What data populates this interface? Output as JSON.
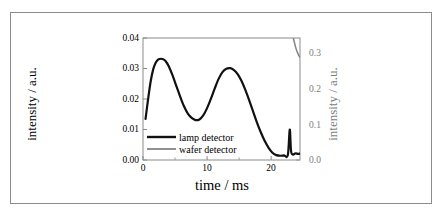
{
  "figure": {
    "border_color": "#8c8c8c",
    "background": "#ffffff"
  },
  "chart_data": {
    "type": "line",
    "title": "",
    "xlabel": "time / ms",
    "ylabel": "intensity / a.u.",
    "ylabel_right": "intensity / a.u.",
    "xlim": [
      0,
      24.5
    ],
    "ylim": [
      0.0,
      0.04
    ],
    "ylim_right": [
      0.0,
      0.0345
    ],
    "grid": false,
    "legend_position": "lower-left-inside",
    "xticks": [
      0,
      10,
      20
    ],
    "xticklabels": [
      "0",
      "10",
      "20"
    ],
    "xminorticks": [
      5,
      15
    ],
    "yticks": [
      0.0,
      0.01,
      0.02,
      0.03,
      0.04
    ],
    "yticklabels": [
      "0.00",
      "0.01",
      "0.02",
      "0.03",
      "0.04"
    ],
    "yticks_right": [
      0.0,
      0.1,
      0.2,
      0.3
    ],
    "yticklabels_right": [
      "0.0",
      "0.1",
      "0.2",
      "0.3"
    ],
    "yminorticks_right": [
      0.05,
      0.15,
      0.25
    ],
    "series": [
      {
        "name": "lamp detector",
        "color": "#111111",
        "axis": "left",
        "x": [
          0.4,
          0.8,
          1.2,
          1.6,
          2.0,
          2.4,
          2.8,
          3.2,
          3.6,
          4.0,
          4.6,
          5.2,
          5.8,
          6.4,
          7.0,
          7.6,
          8.2,
          8.8,
          9.4,
          10.0,
          10.6,
          11.2,
          11.8,
          12.4,
          13.0,
          13.6,
          14.2,
          14.8,
          15.4,
          16.0,
          16.6,
          17.2,
          17.8,
          18.4,
          19.0,
          19.6,
          20.2,
          20.8,
          21.4,
          22.0,
          22.6,
          22.9,
          23.1,
          23.4,
          23.8,
          24.2,
          24.5
        ],
        "y": [
          0.0135,
          0.02,
          0.0258,
          0.0298,
          0.032,
          0.033,
          0.0332,
          0.033,
          0.0322,
          0.0308,
          0.0278,
          0.0243,
          0.0208,
          0.0176,
          0.0152,
          0.0138,
          0.0131,
          0.0133,
          0.0146,
          0.017,
          0.0201,
          0.0235,
          0.0266,
          0.0288,
          0.0299,
          0.0301,
          0.0295,
          0.0281,
          0.0258,
          0.0228,
          0.0194,
          0.0158,
          0.0122,
          0.009,
          0.0062,
          0.004,
          0.0024,
          0.0016,
          0.0014,
          0.0015,
          0.0016,
          0.01,
          0.003,
          0.0018,
          0.0022,
          0.002,
          0.0021
        ]
      },
      {
        "name": "wafer detector",
        "color": "#848484",
        "axis": "right",
        "x": [
          0.4,
          0.8,
          1.2,
          1.6,
          2.0,
          2.4,
          2.8,
          3.2,
          3.6,
          4.0,
          4.6,
          5.2,
          5.8,
          6.4,
          7.0,
          7.6,
          8.2,
          8.8,
          9.4,
          10.0,
          10.6,
          11.2,
          11.8,
          12.4,
          13.0,
          13.6,
          14.2,
          14.8,
          15.4,
          16.0,
          16.6,
          17.2,
          17.8,
          18.4,
          19.0,
          19.6,
          20.2,
          20.8,
          21.4,
          22.0,
          22.6,
          23.2,
          23.8,
          24.2,
          24.5
        ],
        "y": [
          0.115,
          0.175,
          0.232,
          0.272,
          0.294,
          0.302,
          0.304,
          0.303,
          0.3,
          0.295,
          0.285,
          0.275,
          0.267,
          0.26,
          0.256,
          0.253,
          0.253,
          0.255,
          0.259,
          0.265,
          0.272,
          0.28,
          0.288,
          0.293,
          0.296,
          0.298,
          0.298,
          0.296,
          0.291,
          0.283,
          0.271,
          0.255,
          0.236,
          0.213,
          0.188,
          0.16,
          0.131,
          0.104,
          0.08,
          0.06,
          0.046,
          0.037,
          0.032,
          0.03,
          0.029
        ]
      }
    ]
  },
  "legend": {
    "items": [
      {
        "label": "lamp detector",
        "color": "#111111"
      },
      {
        "label": "wafer detector",
        "color": "#848484"
      }
    ]
  }
}
